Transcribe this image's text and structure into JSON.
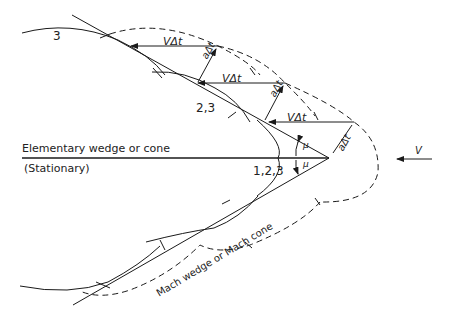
{
  "diagram": {
    "type": "mach-wave-construction",
    "labels": {
      "wedge_title": "Elementary wedge or cone",
      "wedge_state": "(Stationary)",
      "mach_line": "Mach wedge or Mach cone",
      "position_3": "3",
      "position_2_3": "2,3",
      "position_1_2_3": "1,2,3",
      "velocity_incoming": "V",
      "displacement_1": "VΔt",
      "displacement_2": "VΔt",
      "displacement_3": "VΔt",
      "wave_radius_1": "aΔt",
      "wave_radius_2": "aΔt",
      "wave_radius_3": "aΔt",
      "mach_angle_upper": "μ",
      "mach_angle_lower": "μ"
    },
    "colors": {
      "line": "#1a1a1a",
      "background": "#ffffff"
    }
  }
}
